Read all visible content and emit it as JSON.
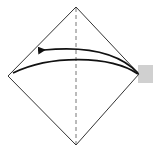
{
  "diagram": {
    "type": "origami-fold-step",
    "colors": {
      "background": "#ffffff",
      "outline": "#333333",
      "arrow": "#111111",
      "crease": "#777777",
      "flap": "#d0d0d0"
    },
    "square": {
      "top": [
        76,
        7
      ],
      "right": [
        139,
        74
      ],
      "bottom": [
        76,
        145
      ],
      "left": [
        8,
        76
      ]
    },
    "crease_line": {
      "style": "dashed",
      "x": 76,
      "y1": 7,
      "y2": 145
    },
    "flap_rect": {
      "x": 138,
      "y": 65,
      "width": 15,
      "height": 18
    },
    "arrows": [
      {
        "name": "fold-arrow",
        "from": [
          138,
          73
        ],
        "to": [
          40,
          50
        ],
        "head": "left"
      },
      {
        "name": "fold-edge-curve",
        "from": [
          138,
          74
        ],
        "to": [
          13,
          73
        ],
        "head": "none"
      }
    ]
  }
}
